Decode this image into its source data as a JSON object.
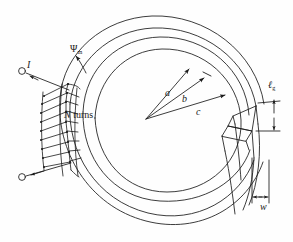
{
  "figure": {
    "type": "engineering-line-diagram",
    "width_px": 293,
    "height_px": 242,
    "background_color": "#ffffff",
    "line_color": "#1a1a1a",
    "labels": {
      "current": "I",
      "flux": "Ψ",
      "flux_subscript": "m",
      "turns": "N turns",
      "turns_symbol": "N",
      "turns_word": " turns",
      "radius_inner": "a",
      "radius_mid": "b",
      "radius_outer": "c",
      "gap_length": "ℓ",
      "gap_length_subscript": "g",
      "core_width": "w"
    },
    "elements": {
      "terminal_top": "open-circle-terminal",
      "terminal_bottom": "open-circle-terminal",
      "winding_turns_drawn": 9,
      "concentric_arcs": 3,
      "radius_lines": 3,
      "air_gap_position": "right",
      "dimension_arrows": [
        "gap-length-vertical",
        "core-width-horizontal"
      ]
    }
  }
}
